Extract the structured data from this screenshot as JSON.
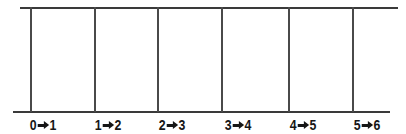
{
  "figure": {
    "background_color": "#ffffff",
    "line_color": "#3a3a3a",
    "text_color": "#161616",
    "top_rule": {
      "x": 20,
      "y": 7,
      "width": 378,
      "height": 2
    },
    "bottom_rule": {
      "x": 13,
      "y": 111,
      "width": 377,
      "height": 2
    },
    "dividers": [
      {
        "name": "divider-0",
        "x": 30
      },
      {
        "name": "divider-1",
        "x": 94
      },
      {
        "name": "divider-2",
        "x": 157
      },
      {
        "name": "divider-3",
        "x": 221
      },
      {
        "name": "divider-4",
        "x": 288
      },
      {
        "name": "divider-5",
        "x": 352
      }
    ],
    "divider_top": 7,
    "divider_height": 105,
    "divider_width": 2,
    "labels": [
      {
        "name": "interval-label-0-1",
        "from": "0",
        "to": "1",
        "arrow": "right-arrow-icon",
        "center": 43
      },
      {
        "name": "interval-label-1-2",
        "from": "1",
        "to": "2",
        "arrow": "right-arrow-icon",
        "center": 108
      },
      {
        "name": "interval-label-2-3",
        "from": "2",
        "to": "3",
        "arrow": "right-arrow-icon",
        "center": 172
      },
      {
        "name": "interval-label-3-4",
        "from": "3",
        "to": "4",
        "arrow": "right-arrow-icon",
        "center": 238
      },
      {
        "name": "interval-label-4-5",
        "from": "4",
        "to": "5",
        "arrow": "right-arrow-icon",
        "center": 303
      },
      {
        "name": "interval-label-5-6",
        "from": "5",
        "to": "6",
        "arrow": "right-arrow-icon",
        "center": 367
      }
    ]
  }
}
